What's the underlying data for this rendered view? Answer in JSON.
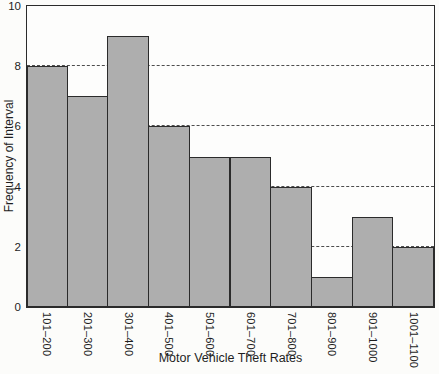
{
  "figure": {
    "background": "#fcfcfa"
  },
  "chart_data": {
    "type": "bar",
    "chart_kind": "histogram",
    "title": "",
    "xlabel": "Motor Vehicle Theft Rates",
    "ylabel": "Frequency of Interval",
    "categories": [
      "101–200",
      "201–300",
      "301–400",
      "401–500",
      "501–600",
      "601–700",
      "701–800",
      "801–900",
      "901–1000",
      "1001–1100"
    ],
    "values": [
      8,
      7,
      9,
      6,
      5,
      5,
      4,
      1,
      3,
      2
    ],
    "ylim": [
      0,
      10
    ],
    "yticks": [
      0,
      2,
      4,
      6,
      8,
      10
    ],
    "gridlines_y": [
      2,
      4,
      6,
      8
    ],
    "gridline_style": "dashed",
    "grid": "horizontal-only",
    "legend_position": "none",
    "bar_fill": "#aeaeae",
    "bar_border": "#2b2b2b",
    "frame_color": "#2b2b2b",
    "gridline_color": "#4d4d4d",
    "text_color": "#1e1e1e"
  }
}
